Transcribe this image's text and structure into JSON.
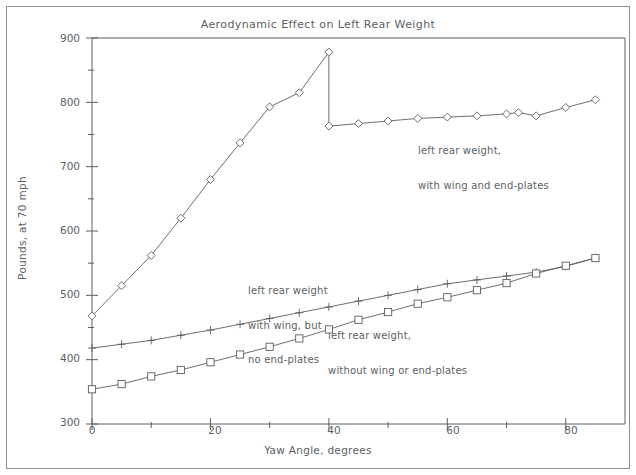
{
  "chart_data": {
    "type": "line",
    "title": "Aerodynamic Effect on Left Rear Weight",
    "xlabel": "Yaw Angle, degrees",
    "ylabel": "Pounds, at 70 mph",
    "xlim": [
      0,
      90
    ],
    "ylim": [
      300,
      900
    ],
    "xticks_major": [
      0,
      20,
      40,
      60,
      80
    ],
    "xticks_minor": [
      10,
      30,
      50,
      70
    ],
    "yticks_major": [
      300,
      400,
      500,
      600,
      700,
      800,
      900
    ],
    "yticks_minor": [
      350,
      450,
      550,
      650,
      750,
      850
    ],
    "grid": false,
    "legend_position": "inline-annotations",
    "series": [
      {
        "name": "left rear weight, with wing and end-plates",
        "marker": "diamond",
        "x": [
          0,
          5,
          10,
          15,
          20,
          25,
          30,
          35,
          40,
          40,
          45,
          50,
          55,
          60,
          65,
          70,
          72,
          75,
          80,
          85
        ],
        "values": [
          468,
          515,
          562,
          620,
          680,
          737,
          793,
          815,
          878,
          763,
          767,
          771,
          775,
          777,
          779,
          782,
          784,
          779,
          792,
          804
        ]
      },
      {
        "name": "left rear weight, with wing, but no end-plates",
        "marker": "plus",
        "x": [
          0,
          5,
          10,
          15,
          20,
          25,
          30,
          35,
          40,
          45,
          50,
          55,
          60,
          65,
          70,
          75,
          80,
          85
        ],
        "values": [
          418,
          424,
          430,
          438,
          446,
          455,
          464,
          473,
          482,
          491,
          500,
          509,
          518,
          524,
          530,
          536,
          545,
          558
        ]
      },
      {
        "name": "left rear weight, without wing or end-plates",
        "marker": "square",
        "x": [
          0,
          5,
          10,
          15,
          20,
          25,
          30,
          35,
          40,
          45,
          50,
          55,
          60,
          65,
          70,
          75,
          80,
          85
        ],
        "values": [
          354,
          362,
          374,
          384,
          396,
          408,
          420,
          433,
          447,
          462,
          474,
          487,
          497,
          508,
          519,
          534,
          546,
          558
        ]
      }
    ],
    "annotations": [
      {
        "id": "annot-wing-endplates",
        "line1": "left rear weight,",
        "line2": "with wing and end-plates",
        "x": 418,
        "y": 122
      },
      {
        "id": "annot-wing-no-endplates",
        "line1": "left rear weight",
        "line2": "with wing, but",
        "line3": "no end-plates",
        "x": 248,
        "y": 262
      },
      {
        "id": "annot-no-wing",
        "line1": "left rear weight,",
        "line2": "without wing or end-plates",
        "x": 328,
        "y": 307
      }
    ],
    "colors": {
      "axis": "#5a5f64",
      "series_line": "#5a5f64",
      "frame": "#8b9096",
      "background": "#ffffff"
    }
  }
}
